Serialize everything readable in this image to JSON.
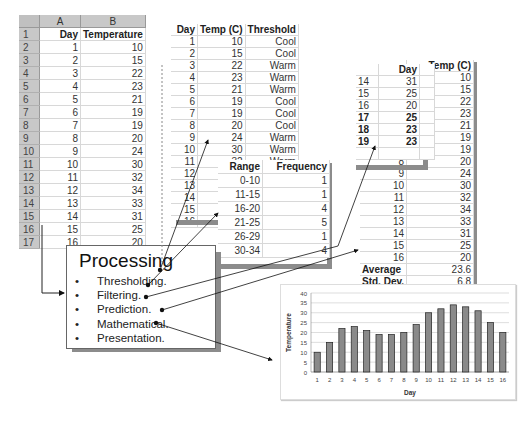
{
  "sheet1": {
    "col_headers": [
      "A",
      "B"
    ],
    "headers": [
      "Day",
      "Temperature"
    ],
    "row_numbers": [
      "1",
      "2",
      "3",
      "4",
      "5",
      "6",
      "7",
      "8",
      "9",
      "10",
      "11",
      "12",
      "13",
      "14",
      "15",
      "16",
      "17"
    ],
    "rows": [
      [
        "1",
        "10"
      ],
      [
        "2",
        "15"
      ],
      [
        "3",
        "22"
      ],
      [
        "4",
        "23"
      ],
      [
        "5",
        "21"
      ],
      [
        "6",
        "19"
      ],
      [
        "7",
        "19"
      ],
      [
        "8",
        "20"
      ],
      [
        "9",
        "24"
      ],
      [
        "10",
        "30"
      ],
      [
        "11",
        "32"
      ],
      [
        "12",
        "34"
      ],
      [
        "13",
        "33"
      ],
      [
        "14",
        "31"
      ],
      [
        "15",
        "25"
      ],
      [
        "16",
        "20"
      ]
    ]
  },
  "threshold_table": {
    "headers": [
      "Day",
      "Temp (C)",
      "Threshold"
    ],
    "rows": [
      [
        "1",
        "10",
        "Cool"
      ],
      [
        "2",
        "15",
        "Cool"
      ],
      [
        "3",
        "22",
        "Warm"
      ],
      [
        "4",
        "23",
        "Warm"
      ],
      [
        "5",
        "21",
        "Warm"
      ],
      [
        "6",
        "19",
        "Cool"
      ],
      [
        "7",
        "19",
        "Cool"
      ],
      [
        "8",
        "20",
        "Cool"
      ],
      [
        "9",
        "24",
        "Warm"
      ],
      [
        "10",
        "30",
        "Warm"
      ],
      [
        "11",
        "32",
        "Warm"
      ]
    ],
    "extra_day_numbers": [
      "12",
      "13",
      "14",
      "15",
      "16"
    ]
  },
  "frequency_table": {
    "headers": [
      "Range",
      "Frequency"
    ],
    "rows": [
      [
        "0-10",
        "1"
      ],
      [
        "11-15",
        "1"
      ],
      [
        "16-20",
        "4"
      ],
      [
        "21-25",
        "5"
      ],
      [
        "26-29",
        "1"
      ],
      [
        "30-34",
        "4"
      ]
    ]
  },
  "prediction_table": {
    "headers": [
      "Day",
      ""
    ],
    "rows": [
      [
        "14",
        "31"
      ],
      [
        "15",
        "25"
      ],
      [
        "16",
        "20"
      ],
      [
        "17",
        "25"
      ],
      [
        "18",
        "23"
      ],
      [
        "19",
        "23"
      ]
    ],
    "bold_rows": [
      3,
      4,
      5
    ]
  },
  "stats_table": {
    "headers": [
      "",
      "Temp (C)"
    ],
    "temps": [
      "10",
      "15",
      "22",
      "23",
      "21",
      "19",
      "19",
      "20",
      "24",
      "30",
      "32",
      "34",
      "33",
      "31",
      "25",
      "20"
    ],
    "days_visible": [
      "8",
      "9",
      "10",
      "11",
      "12",
      "13",
      "14",
      "15",
      "16"
    ],
    "average_label": "Average",
    "average_value": "23.6",
    "stddev_label": "Std. Dev.",
    "stddev_value": "6.8"
  },
  "processing": {
    "title": "Processing",
    "items": [
      "Thresholding.",
      "Filtering.",
      "Prediction.",
      "Mathematical.",
      "Presentation."
    ],
    "bullet": "•"
  },
  "chart_data": {
    "type": "bar",
    "categories": [
      "1",
      "2",
      "3",
      "4",
      "5",
      "6",
      "7",
      "8",
      "9",
      "10",
      "11",
      "12",
      "13",
      "14",
      "15",
      "16"
    ],
    "values": [
      10,
      15,
      22,
      23,
      21,
      19,
      19,
      20,
      24,
      30,
      32,
      34,
      33,
      31,
      25,
      20
    ],
    "title": "",
    "xlabel": "Day",
    "ylabel": "Temperature",
    "ylim": [
      0,
      40
    ],
    "yticks": [
      0,
      5,
      10,
      15,
      20,
      25,
      30,
      35,
      40
    ],
    "grid": true,
    "legend": "none",
    "bar_color": "#8a8a8a"
  }
}
